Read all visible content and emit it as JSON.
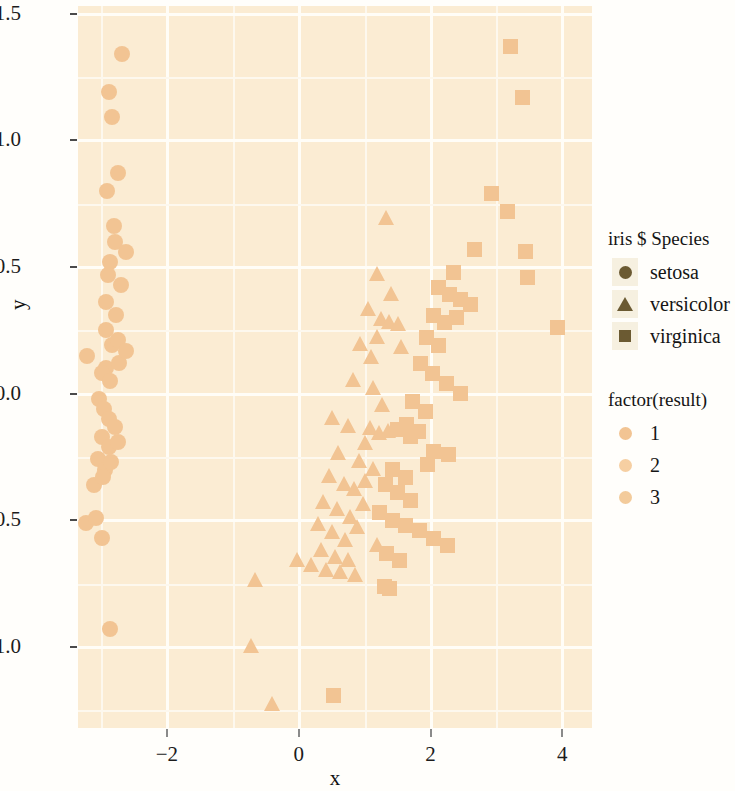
{
  "figure": {
    "background": "#fffefb",
    "panel_background": "#fbecd3",
    "grid_color": "#fffdf7"
  },
  "axes": {
    "xlabel": "x",
    "ylabel": "y",
    "x_ticks": [
      "-2",
      "0",
      "2",
      "4"
    ],
    "y_ticks": [
      "1.5",
      "1.0",
      "0.5",
      "0.0",
      "-0.5",
      "-1.0"
    ],
    "xlim": [
      -3.35,
      4.45
    ],
    "ylim": [
      -1.32,
      1.53
    ]
  },
  "legends": [
    {
      "id": "species",
      "title": "iris $ Species",
      "swatch_background": "#f6f0e0",
      "items": [
        {
          "label": "setosa",
          "shape": "circle",
          "color": "#6b5a32"
        },
        {
          "label": "versicolor",
          "shape": "triangle",
          "color": "#6b5a32"
        },
        {
          "label": "virginica",
          "shape": "square",
          "color": "#6b5a32"
        }
      ]
    },
    {
      "id": "result",
      "title": "factor(result)",
      "swatch_background": "transparent",
      "items": [
        {
          "label": "1",
          "shape": "circle",
          "color": "#f2c493"
        },
        {
          "label": "2",
          "shape": "circle",
          "color": "#f6cfa2"
        },
        {
          "label": "3",
          "shape": "circle",
          "color": "#f3cb9b"
        }
      ]
    }
  ],
  "chart_data": {
    "type": "scatter",
    "title": "",
    "xlabel": "x",
    "ylabel": "y",
    "xlim": [
      -3.35,
      4.45
    ],
    "ylim": [
      -1.32,
      1.53
    ],
    "grid": true,
    "legend_position": "right",
    "marker_color": "#f2c493",
    "shape_legend": "iris $ Species",
    "color_legend": "factor(result)",
    "series": [
      {
        "name": "setosa",
        "shape": "circle",
        "color": "#f2c493",
        "points": [
          [
            -2.68,
            1.34
          ],
          [
            -2.88,
            1.19
          ],
          [
            -2.84,
            1.09
          ],
          [
            -2.91,
            0.8
          ],
          [
            -2.74,
            0.87
          ],
          [
            -2.81,
            0.66
          ],
          [
            -2.79,
            0.6
          ],
          [
            -2.62,
            0.56
          ],
          [
            -2.86,
            0.52
          ],
          [
            -2.89,
            0.47
          ],
          [
            -2.69,
            0.43
          ],
          [
            -2.93,
            0.36
          ],
          [
            -2.78,
            0.31
          ],
          [
            -3.22,
            0.15
          ],
          [
            -2.93,
            0.25
          ],
          [
            -2.84,
            0.19
          ],
          [
            -2.74,
            0.21
          ],
          [
            -2.92,
            0.1
          ],
          [
            -2.99,
            0.08
          ],
          [
            -2.87,
            0.05
          ],
          [
            -2.73,
            0.12
          ],
          [
            -2.62,
            0.17
          ],
          [
            -3.03,
            -0.02
          ],
          [
            -2.95,
            -0.06
          ],
          [
            -2.88,
            -0.1
          ],
          [
            -2.79,
            -0.13
          ],
          [
            -2.99,
            -0.17
          ],
          [
            -2.88,
            -0.21
          ],
          [
            -2.75,
            -0.19
          ],
          [
            -3.04,
            -0.26
          ],
          [
            -2.94,
            -0.3
          ],
          [
            -2.85,
            -0.27
          ],
          [
            -3.1,
            -0.36
          ],
          [
            -2.97,
            -0.33
          ],
          [
            -3.23,
            -0.51
          ],
          [
            -3.08,
            -0.49
          ],
          [
            -2.99,
            -0.57
          ],
          [
            -2.87,
            -0.93
          ]
        ]
      },
      {
        "name": "versicolor",
        "shape": "triangle",
        "color": "#f2c493",
        "points": [
          [
            1.33,
            0.69
          ],
          [
            1.18,
            0.47
          ],
          [
            1.4,
            0.39
          ],
          [
            1.05,
            0.33
          ],
          [
            1.25,
            0.29
          ],
          [
            1.37,
            0.28
          ],
          [
            1.5,
            0.27
          ],
          [
            1.19,
            0.22
          ],
          [
            0.93,
            0.19
          ],
          [
            1.55,
            0.18
          ],
          [
            1.09,
            0.14
          ],
          [
            0.82,
            0.05
          ],
          [
            1.12,
            0.02
          ],
          [
            1.27,
            -0.05
          ],
          [
            0.51,
            -0.1
          ],
          [
            0.74,
            -0.13
          ],
          [
            1.08,
            -0.14
          ],
          [
            1.22,
            -0.16
          ],
          [
            1.36,
            -0.15
          ],
          [
            1.01,
            -0.2
          ],
          [
            0.6,
            -0.24
          ],
          [
            0.92,
            -0.27
          ],
          [
            1.13,
            -0.3
          ],
          [
            0.46,
            -0.33
          ],
          [
            0.69,
            -0.36
          ],
          [
            0.84,
            -0.38
          ],
          [
            1.01,
            -0.35
          ],
          [
            0.37,
            -0.43
          ],
          [
            0.58,
            -0.46
          ],
          [
            0.78,
            -0.49
          ],
          [
            0.97,
            -0.44
          ],
          [
            0.29,
            -0.52
          ],
          [
            0.5,
            -0.55
          ],
          [
            0.7,
            -0.58
          ],
          [
            0.89,
            -0.53
          ],
          [
            0.34,
            -0.62
          ],
          [
            0.55,
            -0.65
          ],
          [
            0.74,
            -0.66
          ],
          [
            0.18,
            -0.68
          ],
          [
            0.41,
            -0.7
          ],
          [
            0.62,
            -0.71
          ],
          [
            0.86,
            -0.72
          ],
          [
            -0.02,
            -0.66
          ],
          [
            1.18,
            -0.6
          ],
          [
            -0.66,
            -0.74
          ],
          [
            -0.72,
            -1.0
          ],
          [
            -0.41,
            -1.23
          ]
        ]
      },
      {
        "name": "virginica",
        "shape": "square",
        "color": "#f2c493",
        "points": [
          [
            3.22,
            1.37
          ],
          [
            3.4,
            1.17
          ],
          [
            2.93,
            0.79
          ],
          [
            3.17,
            0.72
          ],
          [
            2.66,
            0.57
          ],
          [
            3.44,
            0.56
          ],
          [
            2.35,
            0.48
          ],
          [
            3.47,
            0.46
          ],
          [
            2.12,
            0.42
          ],
          [
            2.28,
            0.39
          ],
          [
            2.46,
            0.37
          ],
          [
            2.61,
            0.35
          ],
          [
            2.05,
            0.31
          ],
          [
            2.21,
            0.28
          ],
          [
            2.39,
            0.3
          ],
          [
            3.92,
            0.26
          ],
          [
            1.94,
            0.22
          ],
          [
            2.12,
            0.19
          ],
          [
            1.84,
            0.12
          ],
          [
            2.03,
            0.08
          ],
          [
            2.24,
            0.04
          ],
          [
            2.46,
            0.0
          ],
          [
            1.73,
            -0.03
          ],
          [
            1.93,
            -0.07
          ],
          [
            1.63,
            -0.12
          ],
          [
            1.82,
            -0.15
          ],
          [
            1.5,
            -0.14
          ],
          [
            1.69,
            -0.17
          ],
          [
            2.05,
            -0.23
          ],
          [
            2.27,
            -0.24
          ],
          [
            1.95,
            -0.28
          ],
          [
            1.43,
            -0.3
          ],
          [
            1.62,
            -0.33
          ],
          [
            1.31,
            -0.36
          ],
          [
            1.5,
            -0.39
          ],
          [
            1.7,
            -0.42
          ],
          [
            1.22,
            -0.47
          ],
          [
            1.42,
            -0.5
          ],
          [
            1.62,
            -0.52
          ],
          [
            1.83,
            -0.54
          ],
          [
            2.04,
            -0.57
          ],
          [
            2.26,
            -0.6
          ],
          [
            1.33,
            -0.63
          ],
          [
            1.53,
            -0.66
          ],
          [
            1.3,
            -0.76
          ],
          [
            1.38,
            -0.77
          ],
          [
            0.52,
            -1.19
          ]
        ]
      }
    ]
  }
}
